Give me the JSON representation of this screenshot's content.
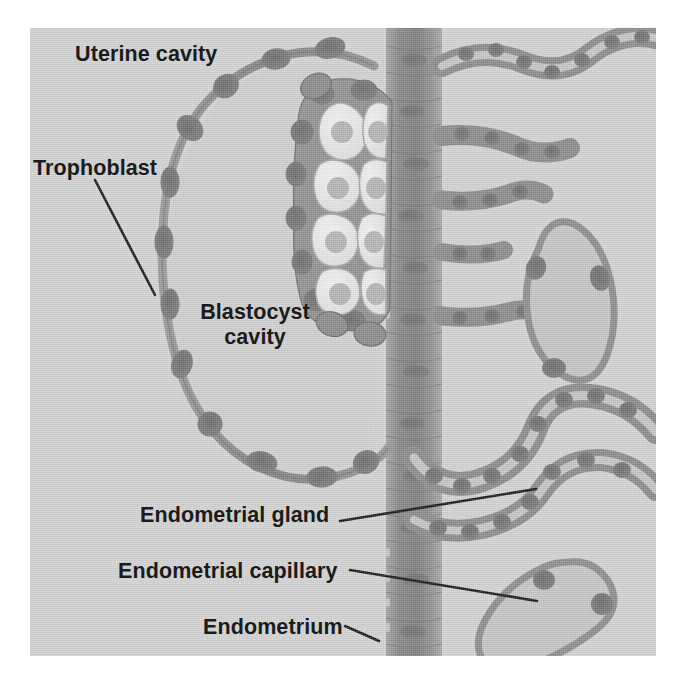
{
  "figure": {
    "background_color": "#d2d2d2",
    "ink_color": "#1b1b1b",
    "tissue_color": "#8e8e8e",
    "tissue_dark_color": "#6e6e6e",
    "lumen_color": "#c2c2c2",
    "cell_light_color": "#ececec",
    "canvas": {
      "width": 683,
      "height": 689
    }
  },
  "labels": {
    "uterine_cavity": "Uterine cavity",
    "trophoblast": "Trophoblast",
    "blastocyst_cavity_line1": "Blastocyst",
    "blastocyst_cavity_line2": "cavity",
    "endometrial_gland": "Endometrial gland",
    "endometrial_capillary": "Endometrial capillary",
    "endometrium": "Endometrium"
  },
  "structures": [
    {
      "name": "uterine-cavity",
      "description": "Open gray space at upper left of the section"
    },
    {
      "name": "trophoblast",
      "description": "Thin wavy cell wall enclosing the blastocyst, with periodic nuclei bulges"
    },
    {
      "name": "blastocyst-cavity",
      "description": "Large pale oval space inside the trophoblast wall"
    },
    {
      "name": "inner-cell-mass",
      "description": "Cluster of pale polygonal cells with nuclei at the implantation pole"
    },
    {
      "name": "endometrium",
      "description": "Vertical striated tissue band running the height of the section"
    },
    {
      "name": "endometrial-gland",
      "description": "Coiled tubular gland with cuboidal cell wall, branching to the right"
    },
    {
      "name": "endometrial-capillary",
      "description": "Irregular thin-walled vessel blobs in the stroma"
    }
  ],
  "leader_lines": [
    {
      "name": "trophoblast-leader",
      "from": [
        95,
        180
      ],
      "to": [
        155,
        295
      ]
    },
    {
      "name": "endometrial-gland-leader",
      "from": [
        340,
        521
      ],
      "to": [
        536,
        489
      ]
    },
    {
      "name": "endometrial-capillary-leader",
      "from": [
        350,
        570
      ],
      "to": [
        537,
        601
      ]
    },
    {
      "name": "endometrium-leader",
      "from": [
        345,
        626
      ],
      "to": [
        379,
        641
      ]
    }
  ]
}
